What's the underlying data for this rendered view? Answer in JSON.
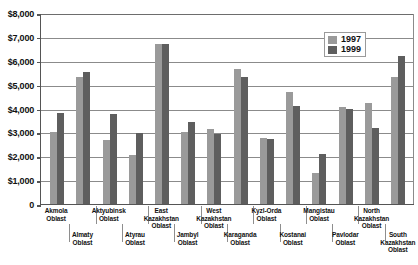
{
  "chart_data": {
    "type": "bar",
    "title": "",
    "subtitle": "",
    "xlabel": "",
    "ylabel": "",
    "ylim": [
      0,
      8000
    ],
    "ytick_values": [
      0,
      1000,
      2000,
      3000,
      4000,
      5000,
      6000,
      7000,
      8000
    ],
    "ytick_labels": [
      "0",
      "$1,000",
      "$2,000",
      "$3,000",
      "$4,000",
      "$5,000",
      "$6,000",
      "$7,000",
      "$8,000"
    ],
    "grid": true,
    "legend_position": "upper-right-inside",
    "categories": [
      "Akmola Oblast",
      "Almaty Oblast",
      "Aktyubinsk Oblast",
      "Atyrau Oblast",
      "East Kazakhstan Oblast",
      "Jambyl Oblast",
      "West Kazakhstan Oblast",
      "Karaganda Oblast",
      "Kyzl-Orda Oblast",
      "Kostanai Oblast",
      "Mangistau Oblast",
      "Pavlodar Oblast",
      "North Kazakhstan Oblast",
      "South Kazakhstan Oblast"
    ],
    "category_lines": [
      [
        "Akmola",
        "Oblast"
      ],
      [
        "Almaty",
        "Oblast"
      ],
      [
        "Aktyubinsk",
        "Oblast"
      ],
      [
        "Atyrau",
        "Oblast"
      ],
      [
        "East",
        "Kazakhstan",
        "Oblast"
      ],
      [
        "Jambyl",
        "Oblast"
      ],
      [
        "West",
        "Kazakhstan",
        "Oblast"
      ],
      [
        "Karaganda",
        "Oblast"
      ],
      [
        "Kyzl-Orda",
        "Oblast"
      ],
      [
        "Kostanai",
        "Oblast"
      ],
      [
        "Mangistau",
        "Oblast"
      ],
      [
        "Pavlodar",
        "Oblast"
      ],
      [
        "North",
        "Kazakhstan",
        "Oblast"
      ],
      [
        "South",
        "Kazakhstan",
        "Oblast"
      ]
    ],
    "series": [
      {
        "name": "1997",
        "color": "#9a9a9a",
        "values": [
          3030,
          5320,
          2670,
          2060,
          6700,
          3020,
          3150,
          5650,
          2760,
          4700,
          1280,
          4050,
          4250,
          5300
        ]
      },
      {
        "name": "1999",
        "color": "#5e5e5e",
        "values": [
          3800,
          5540,
          3790,
          2990,
          6690,
          3430,
          2930,
          5300,
          2720,
          4110,
          2090,
          3980,
          3170,
          6220
        ]
      }
    ]
  },
  "legend": {
    "entries": [
      {
        "label": "1997"
      },
      {
        "label": "1999"
      }
    ]
  }
}
